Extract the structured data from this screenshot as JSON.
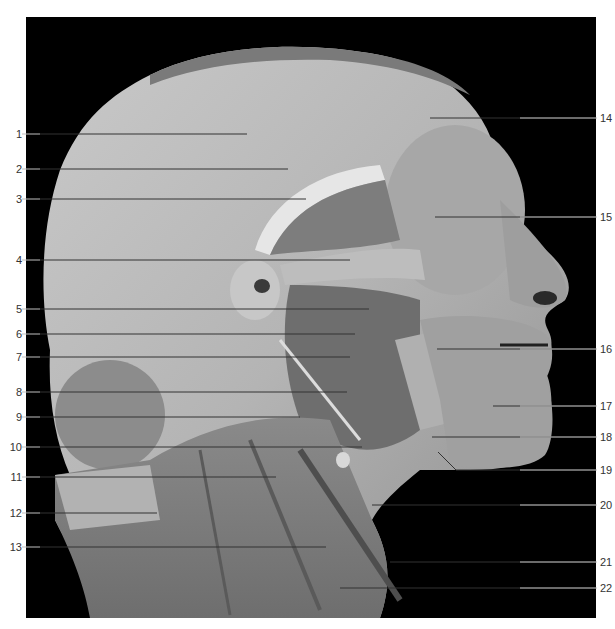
{
  "figure": {
    "background_color": "#000000",
    "frame_color": "#ffffff",
    "leader_line_color_outside": "#bfbfbf",
    "leader_line_color_inside": "#333333",
    "labels_left": [
      {
        "num": "1",
        "y": 134,
        "end_x": 247
      },
      {
        "num": "2",
        "y": 169,
        "end_x": 288
      },
      {
        "num": "3",
        "y": 199,
        "end_x": 306
      },
      {
        "num": "4",
        "y": 260,
        "end_x": 350
      },
      {
        "num": "5",
        "y": 309,
        "end_x": 369
      },
      {
        "num": "6",
        "y": 334,
        "end_x": 355
      },
      {
        "num": "7",
        "y": 357,
        "end_x": 350
      },
      {
        "num": "8",
        "y": 392,
        "end_x": 347
      },
      {
        "num": "9",
        "y": 417,
        "end_x": 300
      },
      {
        "num": "10",
        "y": 447,
        "end_x": 362
      },
      {
        "num": "11",
        "y": 477,
        "end_x": 276
      },
      {
        "num": "12",
        "y": 513,
        "end_x": 157
      },
      {
        "num": "13",
        "y": 547,
        "end_x": 326
      }
    ],
    "labels_right": [
      {
        "num": "14",
        "y": 118,
        "start_x": 430
      },
      {
        "num": "15",
        "y": 217,
        "start_x": 435
      },
      {
        "num": "16",
        "y": 349,
        "start_x": 437
      },
      {
        "num": "17",
        "y": 406,
        "start_x": 493
      },
      {
        "num": "18",
        "y": 437,
        "start_x": 432
      },
      {
        "num": "19",
        "y": 470,
        "start_x": 456
      },
      {
        "num": "20",
        "y": 505,
        "start_x": 372
      },
      {
        "num": "21",
        "y": 562,
        "start_x": 390
      },
      {
        "num": "22",
        "y": 588,
        "start_x": 340
      }
    ]
  }
}
